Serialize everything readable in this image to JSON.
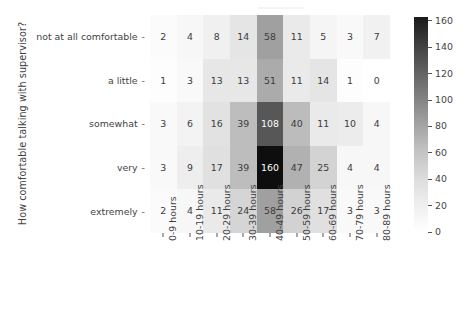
{
  "figure": {
    "ylabel": "How comfortable talking with supervisor?",
    "title_clipped": ""
  },
  "chart_data": {
    "type": "heatmap",
    "title": "",
    "xlabel": "",
    "ylabel": "How comfortable talking with supervisor?",
    "categories_x": [
      "0-9 hours",
      "10-19 hours",
      "20-29 hours",
      "30-39 hours",
      "40-49 hours",
      "50-59 hours",
      "60-69 hours",
      "70-79 hours",
      "80-89 hours"
    ],
    "categories_y": [
      "not at all comfortable",
      "a little",
      "somewhat",
      "very",
      "extremely"
    ],
    "values": [
      [
        2,
        4,
        8,
        14,
        58,
        11,
        5,
        3,
        7
      ],
      [
        1,
        3,
        13,
        13,
        51,
        11,
        14,
        1,
        0
      ],
      [
        3,
        6,
        16,
        39,
        108,
        40,
        11,
        10,
        4
      ],
      [
        3,
        9,
        17,
        39,
        160,
        47,
        25,
        4,
        4
      ],
      [
        2,
        4,
        11,
        24,
        58,
        26,
        17,
        3,
        3
      ]
    ],
    "annot": true,
    "cmap": "Greys",
    "vmin": 0,
    "vmax": 163,
    "grid": false,
    "legend_position": "right",
    "colorbar": {
      "ticks": [
        0,
        20,
        40,
        60,
        80,
        100,
        120,
        140,
        160
      ],
      "tick_labels": [
        "0",
        "20",
        "40",
        "60",
        "80",
        "100",
        "120",
        "140",
        "160"
      ],
      "min": 0,
      "max": 163,
      "low_color": "#ffffff",
      "high_color": "#1b1b1b"
    }
  },
  "colors": {
    "text": "#3f3f3f",
    "cell_text_dark": "#3b3b3b",
    "cell_text_light": "#ffffff",
    "background": "#ffffff",
    "tick": "#555555"
  }
}
